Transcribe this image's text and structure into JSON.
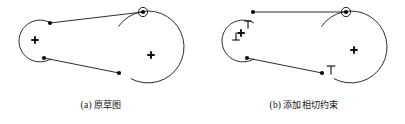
{
  "figure": {
    "type": "cad-sketch-comparison",
    "background_color": "#ffffff",
    "line_color": "#161616",
    "point_color": "#0a0a0a"
  },
  "panels": [
    {
      "id": "a",
      "caption_index": "(a)",
      "caption_text": "原草图",
      "geometry": {
        "description": "slot-like closed profile: small left arc, large right arc, two connecting lines",
        "left_arc": {
          "cx": 40,
          "cy": 41,
          "r": 21,
          "start_angle_deg": 300,
          "end_angle_deg": 60,
          "sweep": "ccw"
        },
        "right_arc": {
          "cx": 148,
          "cy": 47,
          "r": 36,
          "start_angle_deg": 215,
          "end_angle_deg": 118,
          "sweep": "cw"
        },
        "upper_line": {
          "x1": 50,
          "y1": 23,
          "x2": 143,
          "y2": 12
        },
        "lower_line": {
          "x1": 44,
          "y1": 58,
          "x2": 119,
          "y2": 73
        }
      },
      "nodes": [
        {
          "name": "upper-left-endpoint",
          "x": 50,
          "y": 23,
          "r": 2.1,
          "selected": false
        },
        {
          "name": "upper-right-endpoint",
          "x": 143,
          "y": 12,
          "r": 2.1,
          "selected": true,
          "ring_r": 4.6
        },
        {
          "name": "lower-left-endpoint",
          "x": 44,
          "y": 58,
          "r": 2.1,
          "selected": false
        },
        {
          "name": "lower-right-endpoint",
          "x": 119,
          "y": 73,
          "r": 2.1,
          "selected": false
        }
      ],
      "center_marks": [
        {
          "name": "left-arc-center",
          "x": 35,
          "y": 40,
          "size": 7.5
        },
        {
          "name": "right-arc-center",
          "x": 151,
          "y": 55,
          "size": 7.5
        }
      ],
      "tangent_marks": []
    },
    {
      "id": "b",
      "caption_index": "(b)",
      "caption_text": "添加相切约束",
      "geometry": {
        "description": "same profile with tangent constraint glyphs applied",
        "left_arc": {
          "cx": 40,
          "cy": 41,
          "r": 21,
          "start_angle_deg": 300,
          "end_angle_deg": 60,
          "sweep": "ccw"
        },
        "right_arc": {
          "cx": 148,
          "cy": 47,
          "r": 36,
          "start_angle_deg": 215,
          "end_angle_deg": 118,
          "sweep": "cw"
        },
        "upper_line": {
          "x1": 50,
          "y1": 12,
          "x2": 143,
          "y2": 12
        },
        "lower_line": {
          "x1": 44,
          "y1": 58,
          "x2": 119,
          "y2": 73
        }
      },
      "nodes": [
        {
          "name": "upper-left-endpoint",
          "x": 50,
          "y": 12,
          "r": 2.1,
          "selected": false
        },
        {
          "name": "upper-right-endpoint",
          "x": 143,
          "y": 12,
          "r": 2.1,
          "selected": true,
          "ring_r": 4.6
        },
        {
          "name": "lower-left-endpoint",
          "x": 44,
          "y": 58,
          "r": 2.1,
          "selected": false
        },
        {
          "name": "lower-right-endpoint",
          "x": 119,
          "y": 73,
          "r": 2.1,
          "selected": false
        }
      ],
      "center_marks": [
        {
          "name": "left-arc-center",
          "x": 38,
          "y": 33,
          "size": 7.5
        },
        {
          "name": "right-arc-center",
          "x": 151,
          "y": 50,
          "size": 7.5
        }
      ],
      "tangent_marks": [
        {
          "name": "tangent-symbol-upper-left",
          "x": 45,
          "y": 21,
          "orientation": "up",
          "size": 7.5,
          "label": "T"
        },
        {
          "name": "tangent-symbol-lower-left",
          "x": 33,
          "y": 40,
          "orientation": "down",
          "size": 7.5,
          "label": "T"
        },
        {
          "name": "tangent-symbol-lower-right",
          "x": 128,
          "y": 66,
          "orientation": "up",
          "size": 8.5,
          "label": "T"
        }
      ]
    }
  ]
}
